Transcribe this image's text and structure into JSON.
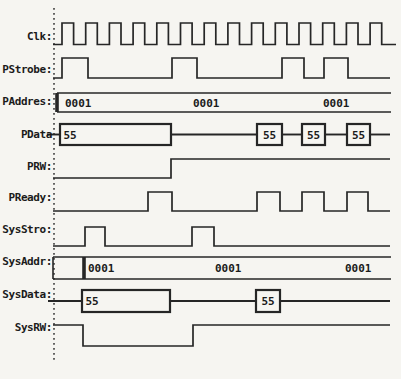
{
  "diagram": {
    "background": "#f6f5f1",
    "line_color": "#262626",
    "text_color": "#1b1b1b",
    "canvas": {
      "width": 401,
      "height": 379
    },
    "time_axis": {
      "dotted_line_x": 54,
      "dotted_line_y1": 8,
      "dotted_line_y2": 361,
      "default_x_end": 390
    },
    "rows": [
      {
        "name": "clk",
        "label": "Clk:",
        "label_y": 37,
        "type": "binary",
        "x_start": 53,
        "x_end": 396,
        "initial": "low",
        "high_y": 23,
        "low_y": 44.5,
        "transitions": [
          62,
          73.6,
          85.7,
          97.3,
          109.4,
          121,
          133.1,
          144.7,
          156.8,
          168.4,
          180.5,
          192.1,
          204.2,
          215.8,
          227.9,
          239.5,
          251.6,
          263.2,
          275.3,
          286.9,
          299,
          310.6,
          322.7,
          334.3,
          346.4,
          358,
          370.1,
          381.7
        ]
      },
      {
        "name": "pstrobe",
        "label": "PStrobe:",
        "label_y": 70,
        "type": "binary",
        "x_start": 53,
        "initial": "low",
        "high_y": 58,
        "low_y": 78,
        "transitions": [
          62,
          88,
          172,
          197,
          282,
          304,
          324,
          348
        ]
      },
      {
        "name": "paddres",
        "label": "PAddres:",
        "label_y": 102,
        "type": "bus_full",
        "x_start": 57,
        "x_end": 391,
        "top_y": 93,
        "bottom_y": 112,
        "transition_xs": [
          57
        ],
        "values": [
          {
            "text": "0001",
            "x": 65
          },
          {
            "text": "0001",
            "x": 193
          },
          {
            "text": "0001",
            "x": 323
          }
        ]
      },
      {
        "name": "pdata",
        "label": "PData",
        "label_y": 135,
        "type": "bus_data",
        "top_y": 124,
        "bottom_y": 145,
        "mid_y": 134.5,
        "segments": [
          {
            "kind": "line",
            "x1": 47,
            "x2": 60
          },
          {
            "kind": "box",
            "x1": 60,
            "x2": 171,
            "label": "55",
            "align": "left"
          },
          {
            "kind": "line",
            "x1": 171,
            "x2": 257
          },
          {
            "kind": "box",
            "x1": 257,
            "x2": 282,
            "label": "55",
            "align": "center"
          },
          {
            "kind": "line",
            "x1": 282,
            "x2": 302
          },
          {
            "kind": "box",
            "x1": 302,
            "x2": 325,
            "label": "55",
            "align": "center"
          },
          {
            "kind": "line",
            "x1": 325,
            "x2": 347
          },
          {
            "kind": "box",
            "x1": 347,
            "x2": 370,
            "label": "55",
            "align": "center"
          },
          {
            "kind": "line",
            "x1": 370,
            "x2": 390
          }
        ]
      },
      {
        "name": "prw",
        "label": "PRW:",
        "label_y": 167,
        "type": "binary",
        "x_start": 53,
        "initial": "low",
        "high_y": 159,
        "low_y": 178,
        "transitions": [
          171
        ]
      },
      {
        "name": "pready",
        "label": "PReady:",
        "label_y": 198,
        "type": "binary",
        "x_start": 53,
        "initial": "low",
        "high_y": 192,
        "low_y": 211,
        "transitions": [
          148,
          172,
          257,
          280,
          302,
          324,
          347,
          368
        ]
      },
      {
        "name": "sysstro",
        "label": "SysStro:",
        "label_y": 230,
        "type": "binary",
        "x_start": 53,
        "initial": "low",
        "high_y": 227,
        "low_y": 246,
        "transitions": [
          85,
          105,
          192,
          214
        ]
      },
      {
        "name": "sysaddr",
        "label": "SysAddr:",
        "label_y": 262,
        "type": "bus_full",
        "x_start": 53,
        "x_end": 391,
        "top_y": 257,
        "bottom_y": 279,
        "transition_xs": [
          84
        ],
        "values": [
          {
            "text": "0001",
            "x": 88
          },
          {
            "text": "0001",
            "x": 215
          },
          {
            "text": "0001",
            "x": 345
          }
        ]
      },
      {
        "name": "sysdata",
        "label": "SysData:",
        "label_y": 295,
        "type": "bus_data",
        "top_y": 290,
        "bottom_y": 312,
        "mid_y": 301,
        "segments": [
          {
            "kind": "line",
            "x1": 48,
            "x2": 82
          },
          {
            "kind": "box",
            "x1": 82,
            "x2": 170,
            "label": "55",
            "align": "left"
          },
          {
            "kind": "line",
            "x1": 170,
            "x2": 256
          },
          {
            "kind": "box",
            "x1": 256,
            "x2": 280,
            "label": "55",
            "align": "center"
          },
          {
            "kind": "line",
            "x1": 280,
            "x2": 390
          }
        ]
      },
      {
        "name": "sysrw",
        "label": "SysRW:",
        "label_y": 328,
        "type": "binary",
        "x_start": 53,
        "initial": "high",
        "high_y": 325,
        "low_y": 346,
        "transitions": [
          83,
          193
        ]
      }
    ]
  }
}
